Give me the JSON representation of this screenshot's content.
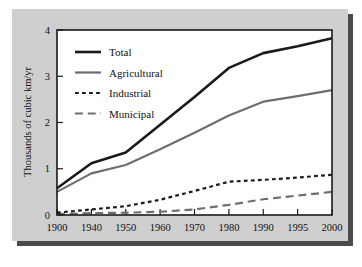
{
  "chart_data": {
    "type": "line",
    "title": "",
    "xlabel": "",
    "ylabel": "Thousands of cubic km/yr",
    "x": [
      "1900",
      "1940",
      "1950",
      "1960",
      "1970",
      "1980",
      "1990",
      "1995",
      "2000"
    ],
    "categories": [
      "1900",
      "1940",
      "1950",
      "1960",
      "1970",
      "1980",
      "1990",
      "1995",
      "2000"
    ],
    "xtick_labels": [
      "1900",
      "1940",
      "1950",
      "1960",
      "1970",
      "1980",
      "1990",
      "1995",
      "2000"
    ],
    "ytick_labels": [
      "0",
      "1",
      "2",
      "3",
      "4"
    ],
    "ytick_values": [
      0,
      1,
      2,
      3,
      4
    ],
    "ylim": [
      0,
      4
    ],
    "grid": "none",
    "legend_position": "top-left inside plot",
    "series": [
      {
        "name": "Total",
        "style": "solid",
        "color": "#1a1a1a",
        "width": 2.6,
        "values": [
          0.58,
          1.12,
          1.35,
          1.95,
          2.55,
          3.18,
          3.5,
          3.65,
          3.82
        ]
      },
      {
        "name": "Agricultural",
        "style": "solid",
        "color": "#6e6e6e",
        "width": 2.2,
        "values": [
          0.5,
          0.9,
          1.08,
          1.42,
          1.78,
          2.15,
          2.45,
          2.57,
          2.7
        ]
      },
      {
        "name": "Industrial",
        "style": "dotted",
        "color": "#1a1a1a",
        "width": 2.2,
        "values": [
          0.05,
          0.12,
          0.19,
          0.33,
          0.52,
          0.72,
          0.76,
          0.81,
          0.87
        ]
      },
      {
        "name": "Municipal",
        "style": "dashed",
        "color": "#6e6e6e",
        "width": 2.2,
        "values": [
          0.02,
          0.04,
          0.05,
          0.07,
          0.12,
          0.22,
          0.34,
          0.42,
          0.5
        ]
      }
    ]
  },
  "legend": {
    "items": [
      {
        "label": "Total"
      },
      {
        "label": "Agricultural"
      },
      {
        "label": "Industrial"
      },
      {
        "label": "Municipal"
      }
    ]
  },
  "axes": {
    "y_title": "Thousands of cubic km/yr"
  },
  "colors": {
    "panel": "#cfcfcf",
    "shadow": "#4a4a4a",
    "plot_background": "#ffffff",
    "frame": "#1a1a1a",
    "dark_series": "#1a1a1a",
    "gray_series": "#6e6e6e"
  }
}
